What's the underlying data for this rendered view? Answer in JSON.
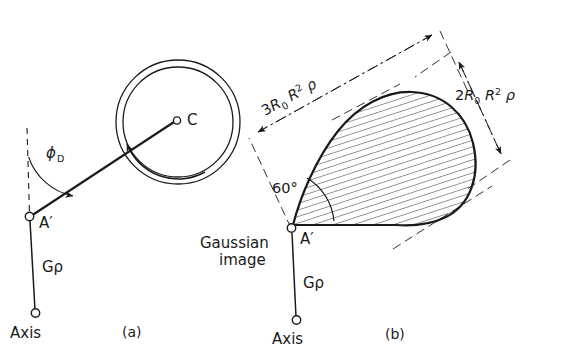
{
  "figure": {
    "background_color": "#ffffff",
    "ink_color": "#1a1a1a"
  },
  "panels": [
    {
      "id": "a",
      "caption": "(a)",
      "labels": {
        "center_point": "C",
        "image_point": "A′",
        "axis": "Axis",
        "height_label": "Gρ",
        "angle_symbol": "ϕ",
        "angle_subscript": "D"
      },
      "annotations": {
        "ring_description": "concentric-circle-pair",
        "rotation_arrow": "counterclockwise-arrow-on-inner-circle",
        "reference_line": "dashed-vertical-reference"
      }
    },
    {
      "id": "b",
      "caption": "(b)",
      "labels": {
        "image_point": "A′",
        "axis": "Axis",
        "height_label": "Gρ",
        "gaussian_line1": "Gaussian",
        "gaussian_line2": "image",
        "angle": "60°"
      },
      "dimensions": [
        {
          "name": "length-dimension",
          "coefficient": "3",
          "base": "R",
          "base_subscript": "0",
          "factor": "R",
          "factor_superscript": "2",
          "density": "ρ",
          "full_text": "3R₀ R² ρ"
        },
        {
          "name": "width-dimension",
          "coefficient": "2",
          "base": "R",
          "base_subscript": "0",
          "factor": "R",
          "factor_superscript": "2",
          "density": "ρ",
          "full_text": "2R₀ R² ρ"
        }
      ],
      "annotations": {
        "patch_description": "hatched-coma-patch",
        "hatch_style": "parallel-diagonal-lines"
      }
    }
  ]
}
